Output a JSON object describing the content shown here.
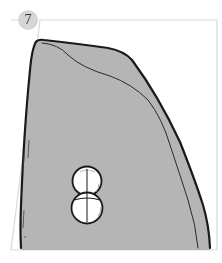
{
  "step": {
    "number": "7",
    "badge_color": "#d6d6d6"
  },
  "illustration": {
    "description": "Gray panel shape with a figure-eight double-circle opening near the bottom center",
    "fill_color": "#b5b5b5",
    "outline_color": "#1a1a1a",
    "frame_color": "#d9d9d9"
  }
}
